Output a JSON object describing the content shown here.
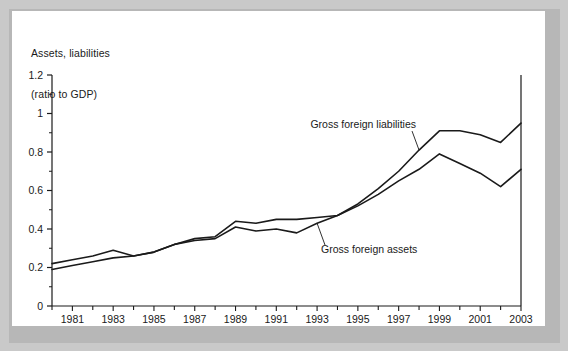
{
  "figure": {
    "title_line1": "Assets, liabilities",
    "title_line2": "(ratio to GDP)",
    "panel_background": "#ffffff",
    "frame_color": "#c9c9c9",
    "line_color": "#1a1a1a"
  },
  "chart_data": {
    "type": "line",
    "title": "Assets, liabilities (ratio to GDP)",
    "xlabel": "",
    "ylabel": "Assets, liabilities (ratio to GDP)",
    "xlim": [
      1980,
      2003
    ],
    "ylim": [
      0,
      1.2
    ],
    "grid": false,
    "legend_position": "inline-annotations",
    "y_ticks": [
      "0",
      "0.2",
      "0.4",
      "0.6",
      "0.8",
      "1",
      "1.2"
    ],
    "y_tick_values": [
      0,
      0.2,
      0.4,
      0.6,
      0.8,
      1,
      1.2
    ],
    "y_minor_tick_values": [
      0.1,
      0.3,
      0.5,
      0.7,
      0.9,
      1.1
    ],
    "x_tick_values": [
      1980,
      1981,
      1982,
      1983,
      1984,
      1985,
      1986,
      1987,
      1988,
      1989,
      1990,
      1991,
      1992,
      1993,
      1994,
      1995,
      1996,
      1997,
      1998,
      1999,
      2000,
      2001,
      2002,
      2003
    ],
    "x_tick_labels": [
      "",
      "1981",
      "",
      "1983",
      "",
      "1985",
      "",
      "1987",
      "",
      "1989",
      "",
      "1991",
      "",
      "1993",
      "",
      "1995",
      "",
      "1997",
      "",
      "1999",
      "",
      "2001",
      "",
      "2003"
    ],
    "x": [
      1980,
      1981,
      1982,
      1983,
      1984,
      1985,
      1986,
      1987,
      1988,
      1989,
      1990,
      1991,
      1992,
      1993,
      1994,
      1995,
      1996,
      1997,
      1998,
      1999,
      2000,
      2001,
      2002,
      2003
    ],
    "series": [
      {
        "name": "Gross foreign liabilities",
        "values": [
          0.22,
          0.24,
          0.26,
          0.29,
          0.26,
          0.28,
          0.32,
          0.35,
          0.36,
          0.44,
          0.43,
          0.45,
          0.45,
          0.46,
          0.47,
          0.53,
          0.61,
          0.7,
          0.81,
          0.91,
          0.91,
          0.89,
          0.85,
          0.95
        ]
      },
      {
        "name": "Gross foreign assets",
        "values": [
          0.19,
          0.21,
          0.23,
          0.25,
          0.26,
          0.28,
          0.32,
          0.34,
          0.35,
          0.41,
          0.39,
          0.4,
          0.38,
          0.43,
          0.47,
          0.52,
          0.58,
          0.65,
          0.71,
          0.79,
          0.74,
          0.69,
          0.62,
          0.71
        ]
      }
    ],
    "annotations": [
      {
        "text": "Gross foreign liabilities",
        "anchor_year": 1998,
        "anchor_value": 0.81
      },
      {
        "text": "Gross foreign assets",
        "anchor_year": 1993,
        "anchor_value": 0.43
      }
    ]
  }
}
